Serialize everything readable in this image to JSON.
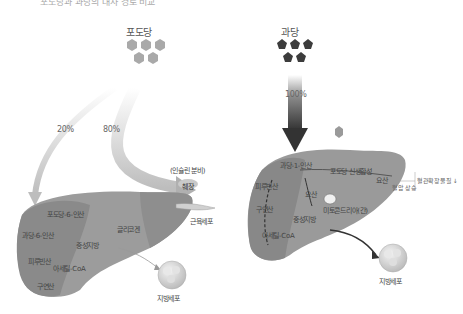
{
  "top_caption": "포도당과 과당의 대사 경로 비교",
  "left_panel": {
    "title": "포도당",
    "molecule_shape": "hexagon",
    "molecule_count": 5,
    "molecule_color": "#a9a9a9",
    "flows": [
      {
        "label": "20%",
        "target": "liver"
      },
      {
        "label": "80%",
        "target": "muscle-cells"
      }
    ],
    "liver_labels": [
      "포도당-6-인산",
      "과당-6-인산",
      "피루빈산",
      "아세틸-CoA",
      "구연산",
      "중성지방",
      "글리코겐"
    ],
    "insulin_label": "(인슐린 분비)",
    "pancreas_label": "췌장",
    "muscle_label": "근육세포",
    "fat_cell_label": "지방세포"
  },
  "right_panel": {
    "title": "과당",
    "molecule_shape": "pentagon",
    "molecule_count": 5,
    "molecule_color": "#3c3c3c",
    "flows": [
      {
        "label": "100%",
        "target": "liver"
      }
    ],
    "liver_labels": [
      "과당-1-인산",
      "포도당 신생합성",
      "피루빈산",
      "요산",
      "구연산",
      "미토콘드리아(간)",
      "아세틸-CoA",
      "중성지방"
    ],
    "uric_acid_label": "요산",
    "uric_acid_effect": "혈압 상승",
    "uric_acid_note": "혈관확장물질 ↓",
    "fat_cell_label": "지방세포"
  },
  "colors": {
    "liver_light": "#9a9a9a",
    "liver_dark": "#7d7d7d",
    "arrow_light": "#c8c8c8",
    "arrow_dark": "#3a3a3a"
  }
}
